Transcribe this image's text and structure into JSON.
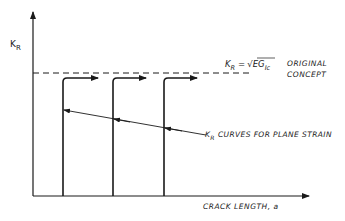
{
  "diagram": {
    "y_axis_label": "K",
    "y_axis_label_sub": "R",
    "x_axis_label": "CRACK LENGTH, a",
    "equation": {
      "lhs": "K",
      "lhs_sub": "R",
      "eq": "=",
      "rhs": "EG",
      "rhs_sub": "Ic"
    },
    "original_concept_line1": "ORIGINAL",
    "original_concept_line2": "CONCEPT",
    "curves_label_k": "K",
    "curves_label_sub": "R",
    "curves_label_text": "CURVES FOR PLANE STRAIN",
    "curve_count": 3,
    "line_color": "#1a1a1a"
  }
}
